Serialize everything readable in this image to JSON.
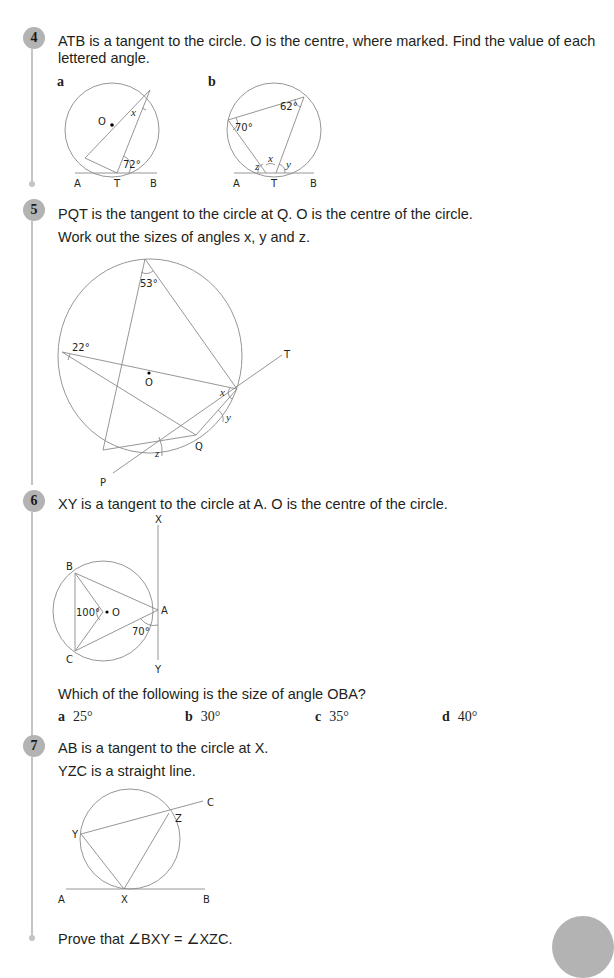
{
  "questions": [
    {
      "number": "4",
      "text_line1": "ATB is a tangent to the circle. O is the centre, where marked. Find the value of each",
      "text_line2": "lettered angle.",
      "parts": [
        {
          "label": "a",
          "points": {
            "A": "A",
            "T": "T",
            "B": "B",
            "O": "O"
          },
          "angles": {
            "given": "72°",
            "unknown": "x"
          }
        },
        {
          "label": "b",
          "points": {
            "A": "A",
            "T": "T",
            "B": "B"
          },
          "angles": {
            "given1": "70°",
            "given2": "62°",
            "x": "x",
            "y": "y",
            "z": "z"
          }
        }
      ]
    },
    {
      "number": "5",
      "text_line1": "PQT is the tangent to the circle at Q. O is the centre of the circle.",
      "text_line2": "Work out the sizes of angles x, y and z.",
      "diagram": {
        "points": {
          "P": "P",
          "Q": "Q",
          "T": "T",
          "O": "O"
        },
        "angles": {
          "a1": "53°",
          "a2": "22°",
          "x": "x",
          "y": "y",
          "z": "z"
        }
      }
    },
    {
      "number": "6",
      "text_line1": "XY is a tangent to the circle at A. O is the centre of the circle.",
      "diagram": {
        "points": {
          "X": "X",
          "Y": "Y",
          "A": "A",
          "B": "B",
          "C": "C",
          "O": "O"
        },
        "angles": {
          "a1": "100°",
          "a2": "70°"
        }
      },
      "question": "Which of the following is the size of angle OBA?",
      "options": [
        {
          "letter": "a",
          "value": "25°"
        },
        {
          "letter": "b",
          "value": "30°"
        },
        {
          "letter": "c",
          "value": "35°"
        },
        {
          "letter": "d",
          "value": "40°"
        }
      ]
    },
    {
      "number": "7",
      "text_line1": "AB is a tangent to the circle at X.",
      "text_line2": "YZC is a straight line.",
      "diagram": {
        "points": {
          "A": "A",
          "B": "B",
          "X": "X",
          "Y": "Y",
          "Z": "Z",
          "C": "C"
        }
      },
      "prove": "Prove that ∠BXY = ∠XZC."
    }
  ],
  "colors": {
    "badge": "#b3b3b3",
    "rail": "#c4c4c4",
    "lines": "#8a8a8a",
    "text": "#231f20"
  }
}
